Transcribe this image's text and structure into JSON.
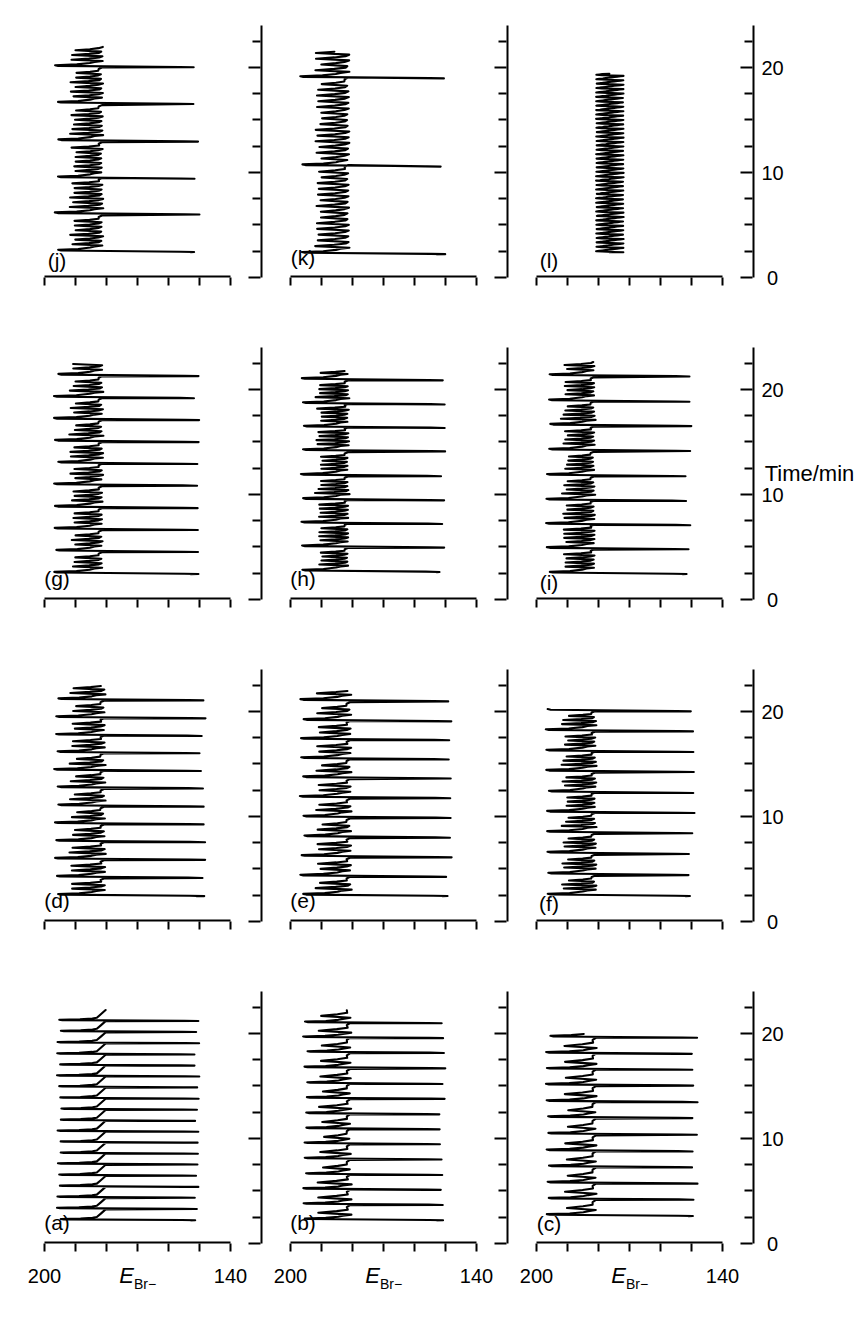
{
  "figure": {
    "axis_titles": {
      "y": "E_Br-",
      "y_main": "E",
      "y_sub": "Br−",
      "x": "Time/min"
    },
    "y_axis": {
      "min": 140,
      "max": 200,
      "labels": [
        "200",
        "140"
      ],
      "tick_step": 10
    },
    "x_axis": {
      "min": 0,
      "max": 24,
      "labels": [
        "0",
        "10",
        "20"
      ],
      "major_step": 10,
      "minor_step": 2.5
    },
    "panels": [
      {
        "id": "a",
        "label": "(a)",
        "row": 0,
        "col": 0
      },
      {
        "id": "b",
        "label": "(b)",
        "row": 1,
        "col": 0
      },
      {
        "id": "c",
        "label": "(c)",
        "row": 2,
        "col": 0
      },
      {
        "id": "d",
        "label": "(d)",
        "row": 0,
        "col": 1
      },
      {
        "id": "e",
        "label": "(e)",
        "row": 1,
        "col": 1
      },
      {
        "id": "f",
        "label": "(f)",
        "row": 2,
        "col": 1
      },
      {
        "id": "g",
        "label": "(g)",
        "row": 0,
        "col": 2
      },
      {
        "id": "h",
        "label": "(h)",
        "row": 1,
        "col": 2
      },
      {
        "id": "i",
        "label": "(i)",
        "row": 2,
        "col": 2
      },
      {
        "id": "j",
        "label": "(j)",
        "row": 0,
        "col": 3
      },
      {
        "id": "k",
        "label": "(k)",
        "row": 1,
        "col": 3
      },
      {
        "id": "l",
        "label": "(l)",
        "row": 2,
        "col": 3
      }
    ]
  },
  "chart_data": {
    "type": "line",
    "title": "",
    "xlabel": "Time/min",
    "ylabel": "E_Br−",
    "xlim": [
      0,
      24
    ],
    "ylim": [
      140,
      200
    ],
    "grid": false,
    "legend": "none",
    "note": "Twelve time-series traces (a)-(l) of bromide-ion electrode potential showing mixed-mode oscillations of the Belousov-Zhabotinsky reaction at increasing control-parameter values.",
    "series": [
      {
        "name": "(a)",
        "pattern": "1^0",
        "large_peaks": 19,
        "small_per_large": 0,
        "period_min": 1.05,
        "start_min": 2.2,
        "end_min": 22.2,
        "peak_max": 196,
        "peak_min": 150
      },
      {
        "name": "(b)",
        "pattern": "1^1",
        "large_peaks": 14,
        "small_per_large": 1,
        "period_min": 1.45,
        "start_min": 2.2,
        "end_min": 22.2,
        "peak_max": 196,
        "peak_min": 150
      },
      {
        "name": "(c)",
        "pattern": "1^1",
        "large_peaks": 12,
        "small_per_large": 1,
        "period_min": 1.55,
        "start_min": 2.6,
        "end_min": 20.0,
        "peak_max": 197,
        "peak_min": 148
      },
      {
        "name": "(d)",
        "pattern": "1^2",
        "large_peaks": 12,
        "small_per_large": 2,
        "period_min": 1.7,
        "start_min": 2.4,
        "end_min": 22.4,
        "peak_max": 197,
        "peak_min": 148
      },
      {
        "name": "(e)",
        "pattern": "1^2",
        "large_peaks": 11,
        "small_per_large": 2,
        "period_min": 1.85,
        "start_min": 2.4,
        "end_min": 22.0,
        "peak_max": 197,
        "peak_min": 148
      },
      {
        "name": "(f)",
        "pattern": "1^3",
        "large_peaks": 10,
        "small_per_large": 3,
        "period_min": 1.95,
        "start_min": 2.4,
        "end_min": 20.2,
        "peak_max": 197,
        "peak_min": 149
      },
      {
        "name": "(g)",
        "pattern": "1^3",
        "large_peaks": 10,
        "small_per_large": 3,
        "period_min": 2.1,
        "start_min": 2.4,
        "end_min": 22.4,
        "peak_max": 197,
        "peak_min": 150
      },
      {
        "name": "(h)",
        "pattern": "1^4",
        "large_peaks": 9,
        "small_per_large": 4,
        "period_min": 2.3,
        "start_min": 2.6,
        "end_min": 21.8,
        "peak_max": 197,
        "peak_min": 150
      },
      {
        "name": "(i)",
        "pattern": "1^4",
        "large_peaks": 9,
        "small_per_large": 4,
        "period_min": 2.35,
        "start_min": 2.4,
        "end_min": 22.6,
        "peak_max": 197,
        "peak_min": 150
      },
      {
        "name": "(j)",
        "pattern": "1^6",
        "large_peaks": 6,
        "small_per_large": 6,
        "period_min": 3.5,
        "start_min": 2.4,
        "end_min": 22.0,
        "peak_max": 197,
        "peak_min": 150
      },
      {
        "name": "(k)",
        "pattern": "1^n (long small-amplitude trains)",
        "large_peaks": 3,
        "small_per_large": 14,
        "period_min": 8.5,
        "start_min": 2.2,
        "end_min": 21.5,
        "peak_max": 197,
        "peak_min": 150
      },
      {
        "name": "(l)",
        "pattern": "0^1",
        "large_peaks": 0,
        "small_per_large": 40,
        "period_min": 0.42,
        "start_min": 2.4,
        "end_min": 19.4,
        "peak_max": 181,
        "peak_min": 172
      }
    ]
  }
}
